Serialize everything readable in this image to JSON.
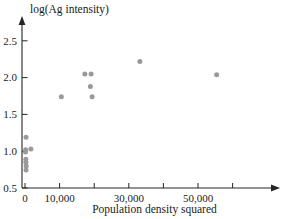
{
  "chart_data": {
    "type": "scatter",
    "title": "",
    "xlabel": "Population density squared",
    "ylabel": "log(Ag intensity)",
    "xlim": [
      0,
      62000
    ],
    "ylim": [
      0.5,
      2.65
    ],
    "grid": false,
    "legend": null,
    "point_color": "#9a9a9a",
    "axis_color": "#262626",
    "background": "#ffffff",
    "xticks": [
      {
        "value": 0,
        "label": "0",
        "major": true
      },
      {
        "value": 10000,
        "label": "10,000",
        "major": true
      },
      {
        "value": 20000,
        "label": "",
        "major": false
      },
      {
        "value": 30000,
        "label": "30,000",
        "major": true
      },
      {
        "value": 40000,
        "label": "",
        "major": false
      },
      {
        "value": 50000,
        "label": "50,000",
        "major": true
      },
      {
        "value": 60000,
        "label": "",
        "major": false
      }
    ],
    "yticks": [
      {
        "value": 0.5,
        "label": "0.5"
      },
      {
        "value": 1.0,
        "label": "1.0"
      },
      {
        "value": 1.5,
        "label": "1.5"
      },
      {
        "value": 2.0,
        "label": "2.0"
      },
      {
        "value": 2.5,
        "label": "2.5"
      }
    ],
    "points": [
      {
        "x": 300,
        "y": 1.19
      },
      {
        "x": 200,
        "y": 1.02
      },
      {
        "x": 1700,
        "y": 1.03
      },
      {
        "x": 150,
        "y": 0.99
      },
      {
        "x": 250,
        "y": 0.89
      },
      {
        "x": 250,
        "y": 0.85
      },
      {
        "x": 350,
        "y": 0.8
      },
      {
        "x": 300,
        "y": 0.745
      },
      {
        "x": 10500,
        "y": 1.74
      },
      {
        "x": 17300,
        "y": 2.05
      },
      {
        "x": 19100,
        "y": 2.05
      },
      {
        "x": 18900,
        "y": 1.88
      },
      {
        "x": 19400,
        "y": 1.74
      },
      {
        "x": 33200,
        "y": 2.22
      },
      {
        "x": 55400,
        "y": 2.04
      }
    ]
  }
}
